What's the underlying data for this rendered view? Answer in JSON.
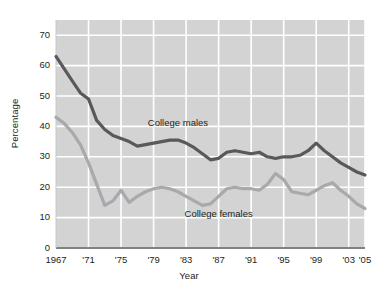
{
  "chart_data": {
    "type": "line",
    "title": "",
    "xlabel": "Year",
    "ylabel": "Percentage",
    "xlim": [
      1967,
      2005
    ],
    "ylim": [
      0,
      75
    ],
    "grid": true,
    "legend_position": "inline-annotation",
    "background_color": "#d3d3d3",
    "gridline_color": "#ffffff",
    "y_ticks": [
      0,
      10,
      20,
      30,
      40,
      50,
      60,
      70
    ],
    "y_tick_labels": [
      "0",
      "10",
      "20",
      "30",
      "40",
      "50",
      "60",
      "70"
    ],
    "x_ticks": [
      1967,
      1971,
      1975,
      1979,
      1983,
      1987,
      1991,
      1995,
      1999,
      2003,
      2005
    ],
    "x_tick_labels": [
      "1967",
      "'71",
      "'75",
      "'79",
      "'83",
      "'87",
      "'91",
      "'95",
      "'99",
      "'03",
      "'05"
    ],
    "x": [
      1967,
      1968,
      1969,
      1970,
      1971,
      1972,
      1973,
      1974,
      1975,
      1976,
      1977,
      1978,
      1979,
      1980,
      1981,
      1982,
      1983,
      1984,
      1985,
      1986,
      1987,
      1988,
      1989,
      1990,
      1991,
      1992,
      1993,
      1994,
      1995,
      1996,
      1997,
      1998,
      1999,
      2000,
      2001,
      2002,
      2003,
      2004,
      2005
    ],
    "series": [
      {
        "name": "College males",
        "color": "#58595b",
        "label_x": 1982,
        "label_y": 41,
        "values": [
          63,
          59,
          55,
          51,
          49,
          42,
          39,
          37,
          36,
          35,
          33.5,
          34,
          34.5,
          35,
          35.5,
          35.5,
          34.5,
          33,
          31,
          29,
          29.5,
          31.5,
          32,
          31.5,
          31,
          31.5,
          30,
          29.5,
          30,
          30,
          30.5,
          32,
          34.5,
          32,
          30,
          28,
          26.5,
          25,
          24
        ]
      },
      {
        "name": "College females",
        "color": "#a7a9ac",
        "label_x": 1987,
        "label_y": 11,
        "values": [
          43,
          41,
          38,
          34,
          28,
          21,
          14,
          15.5,
          19,
          15,
          17,
          18.5,
          19.5,
          20,
          19.5,
          18.5,
          17,
          15.5,
          14,
          14.5,
          17,
          19.5,
          20,
          19.5,
          19.5,
          19,
          21,
          24.5,
          22.5,
          18.5,
          18,
          17.5,
          19,
          20.5,
          21.5,
          19,
          17,
          14.5,
          13
        ]
      }
    ]
  }
}
